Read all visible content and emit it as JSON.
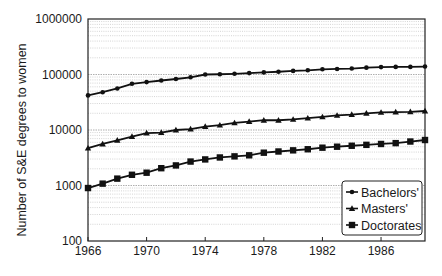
{
  "chart_data": {
    "type": "line",
    "title": "",
    "xlabel": "",
    "ylabel": "Number of S&E degrees to women",
    "yscale": "log",
    "ylim": [
      100,
      1000000
    ],
    "xlim": [
      1966,
      1989
    ],
    "grid": {
      "y_minor_dotted": true,
      "x": false
    },
    "legend_position": "lower right",
    "x_ticks": [
      "1966",
      "1970",
      "1974",
      "1978",
      "1982",
      "1986"
    ],
    "y_ticks": [
      "100",
      "1000",
      "10000",
      "100000",
      "1000000"
    ],
    "x": [
      1966,
      1967,
      1968,
      1969,
      1970,
      1971,
      1972,
      1973,
      1974,
      1975,
      1976,
      1977,
      1978,
      1979,
      1980,
      1981,
      1982,
      1983,
      1984,
      1985,
      1986,
      1987,
      1988,
      1989
    ],
    "series": [
      {
        "name": "Bachelors'",
        "marker": "circle",
        "values": [
          42000,
          48000,
          56000,
          68000,
          73000,
          78000,
          83000,
          89000,
          100000,
          101000,
          103000,
          106000,
          109000,
          112000,
          116000,
          119000,
          124000,
          126000,
          128000,
          133000,
          136000,
          137000,
          137000,
          139000
        ]
      },
      {
        "name": "Masters'",
        "marker": "triangle",
        "values": [
          4700,
          5600,
          6500,
          7600,
          8800,
          9000,
          10000,
          10400,
          11500,
          12200,
          13400,
          14200,
          15000,
          15000,
          15500,
          16300,
          17200,
          18300,
          19000,
          20000,
          20700,
          21000,
          21300,
          22000
        ]
      },
      {
        "name": "Doctorates",
        "marker": "square",
        "values": [
          900,
          1080,
          1330,
          1560,
          1700,
          2050,
          2300,
          2700,
          2950,
          3200,
          3350,
          3500,
          3900,
          4100,
          4300,
          4500,
          4800,
          5000,
          5200,
          5400,
          5600,
          5800,
          6200,
          6600
        ]
      }
    ]
  },
  "legend": {
    "items": [
      "Bachelors'",
      "Masters'",
      "Doctorates"
    ]
  },
  "axis": {
    "ylabel": "Number of S&E degrees to women"
  }
}
